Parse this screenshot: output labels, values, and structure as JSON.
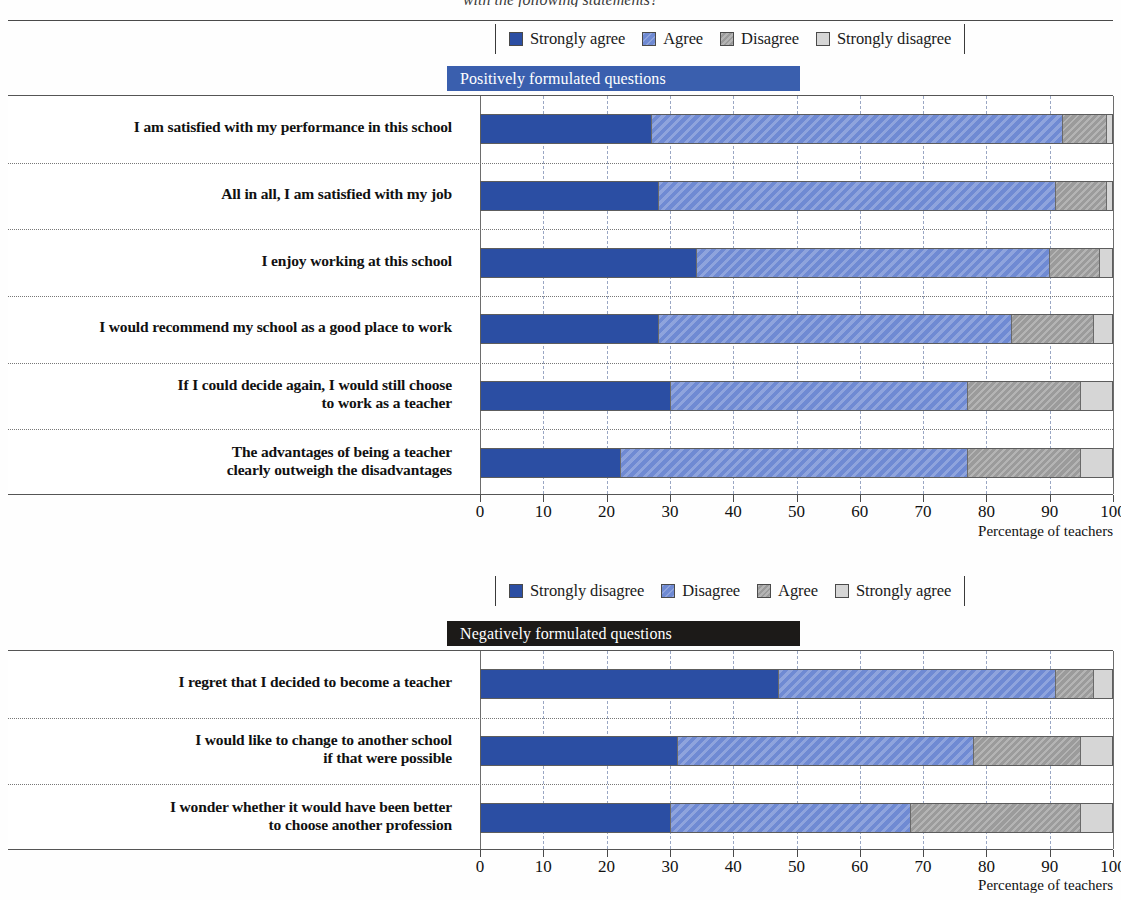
{
  "header": {
    "clipped_title": "with the following statements?"
  },
  "chart_data": [
    {
      "type": "bar",
      "orientation": "horizontal",
      "stacked": true,
      "percent": true,
      "title": "Positively formulated questions",
      "banner_color": "#3a5fae",
      "xlabel": "Percentage of teachers",
      "ylabel": "",
      "xlim": [
        0,
        100
      ],
      "xticks": [
        0,
        10,
        20,
        30,
        40,
        50,
        60,
        70,
        80,
        90,
        100
      ],
      "grid": "vertical-dashed",
      "legend_position": "top",
      "legend": [
        {
          "label": "Strongly agree",
          "color": "#2b4ea3"
        },
        {
          "label": "Agree",
          "color": "#6f8ad3"
        },
        {
          "label": "Disagree",
          "color": "#9b9b9b"
        },
        {
          "label": "Strongly disagree",
          "color": "#d6d6d6"
        }
      ],
      "categories": [
        "I am satisfied with my performance in this school",
        "All in all, I am satisfied with my job",
        "I enjoy working at this school",
        "I would recommend my school as a good place to work",
        "If I could decide again, I would still choose\nto work as a teacher",
        "The advantages of being a teacher\nclearly outweigh the disadvantages"
      ],
      "series": [
        {
          "name": "Strongly agree",
          "values": [
            27,
            28,
            34,
            28,
            30,
            22
          ]
        },
        {
          "name": "Agree",
          "values": [
            65,
            63,
            56,
            56,
            47,
            55
          ]
        },
        {
          "name": "Disagree",
          "values": [
            7,
            8,
            8,
            13,
            18,
            18
          ]
        },
        {
          "name": "Strongly disagree",
          "values": [
            1,
            1,
            2,
            3,
            5,
            5
          ]
        }
      ]
    },
    {
      "type": "bar",
      "orientation": "horizontal",
      "stacked": true,
      "percent": true,
      "title": "Negatively formulated questions",
      "banner_color": "#1c1a18",
      "xlabel": "Percentage of teachers",
      "ylabel": "",
      "xlim": [
        0,
        100
      ],
      "xticks": [
        0,
        10,
        20,
        30,
        40,
        50,
        60,
        70,
        80,
        90,
        100
      ],
      "grid": "vertical-dashed",
      "legend_position": "top",
      "legend": [
        {
          "label": "Strongly disagree",
          "color": "#2b4ea3"
        },
        {
          "label": "Disagree",
          "color": "#6f8ad3"
        },
        {
          "label": "Agree",
          "color": "#9b9b9b"
        },
        {
          "label": "Strongly agree",
          "color": "#d6d6d6"
        }
      ],
      "categories": [
        "I regret that I decided to become a teacher",
        "I would like to change to another school\nif that were possible",
        "I wonder whether it would have been better\nto choose another profession"
      ],
      "series": [
        {
          "name": "Strongly disagree",
          "values": [
            47,
            31,
            30
          ]
        },
        {
          "name": "Disagree",
          "values": [
            44,
            47,
            38
          ]
        },
        {
          "name": "Agree",
          "values": [
            6,
            17,
            27
          ]
        },
        {
          "name": "Strongly agree",
          "values": [
            3,
            5,
            5
          ]
        }
      ]
    }
  ]
}
